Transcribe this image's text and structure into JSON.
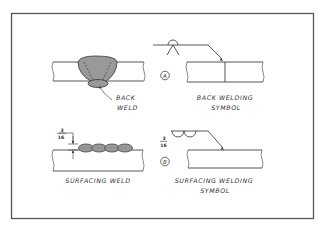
{
  "diagram": {
    "frame": {
      "x": 11,
      "y": 13,
      "width": 302,
      "height": 206,
      "color": "#555555"
    },
    "weld_fill_color": "#999999",
    "panels": [
      {
        "id": "back-weld",
        "labels": [
          "BACK",
          "WELD"
        ]
      },
      {
        "id": "back-welding-symbol",
        "callout": "A",
        "labels": [
          "BACK WELDING",
          "SYMBOL"
        ]
      },
      {
        "id": "surfacing-weld",
        "dimension": {
          "numerator": "3",
          "denominator": "16"
        },
        "labels": [
          "SURFACING WELD"
        ]
      },
      {
        "id": "surfacing-welding-symbol",
        "callout": "B",
        "dimension": {
          "numerator": "3",
          "denominator": "16"
        },
        "labels": [
          "SURFACING WELDING",
          "SYMBOL"
        ]
      }
    ]
  }
}
